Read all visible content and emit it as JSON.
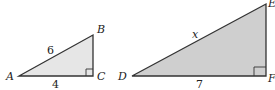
{
  "triangles": [
    {
      "name": "ABC",
      "vertices": {
        "A": "A",
        "B": "B",
        "C": "C"
      },
      "sides": {
        "AB": "6",
        "AC": "4"
      },
      "right_angle_at": "C",
      "fill": "#e6e6e6",
      "stroke": "#333333"
    },
    {
      "name": "DEF",
      "vertices": {
        "D": "D",
        "E": "E",
        "F": "F"
      },
      "sides": {
        "DE": "x",
        "DF": "7"
      },
      "right_angle_at": "F",
      "fill": "#cfcfcf",
      "stroke": "#333333"
    }
  ]
}
